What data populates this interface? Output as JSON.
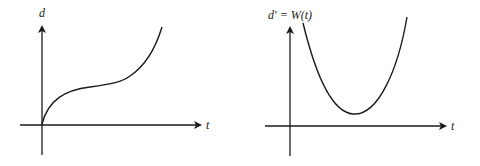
{
  "graphs": [
    {
      "id": "left",
      "y_label": "d",
      "x_label": "t",
      "description": "Increasing cubic-like curve starting at origin, leveling off then rising steeply"
    },
    {
      "id": "right",
      "y_label": "d′ = W(t)",
      "x_label": "t",
      "description": "Upward-opening parabola-like curve with minimum above the t-axis"
    }
  ],
  "colors": {
    "stroke": "#1a1a1a",
    "background": "#ffffff"
  }
}
